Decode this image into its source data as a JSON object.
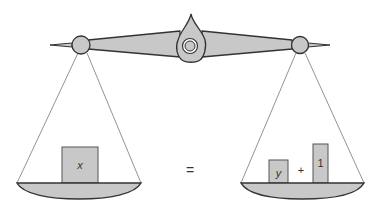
{
  "diagram": {
    "type": "balance-scale-equation",
    "left_pan": {
      "items": [
        {
          "label": "x",
          "kind": "block"
        }
      ]
    },
    "right_pan": {
      "items": [
        {
          "label": "y",
          "kind": "block"
        },
        {
          "label": "+",
          "kind": "operator"
        },
        {
          "label": "1",
          "kind": "block"
        }
      ]
    },
    "equals_sign": "=",
    "plus_sign": "+",
    "labels": {
      "x": "x",
      "y": "y",
      "one": "1"
    }
  },
  "colors": {
    "fill": "#c8c8c8",
    "stroke": "#333333",
    "string": "#777777",
    "background": "#ffffff"
  }
}
